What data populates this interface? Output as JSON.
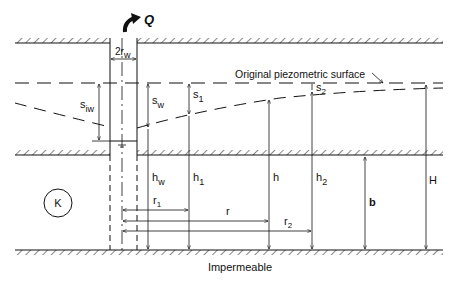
{
  "figure": {
    "type": "confined-aquifer-well-drawdown-diagram",
    "labels": {
      "discharge": "Q",
      "well_diameter": "2r",
      "well_diameter_sub": "w",
      "original_surface": "Original piezometric surface",
      "s_iw": "s",
      "s_iw_sub": "iw",
      "s_w": "s",
      "s_w_sub": "w",
      "s_1": "s",
      "s_1_sub": "1",
      "s_2": "s",
      "s_2_sub": "2",
      "h_w": "h",
      "h_w_sub": "w",
      "h_1": "h",
      "h_1_sub": "1",
      "h": "h",
      "h_2": "h",
      "h_2_sub": "2",
      "b": "b",
      "H": "H",
      "r_1": "r",
      "r_1_sub": "1",
      "r": "r",
      "r_2": "r",
      "r_2_sub": "2",
      "conductivity": "K",
      "base": "Impermeable"
    },
    "colors": {
      "line": "#111111",
      "background": "#ffffff"
    }
  }
}
